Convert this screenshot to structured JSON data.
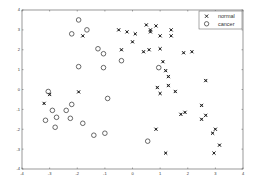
{
  "chart_data": {
    "type": "scatter",
    "title": "",
    "xlabel": "",
    "ylabel": "",
    "xlim": [
      -4,
      4
    ],
    "ylim": [
      -4,
      4
    ],
    "xticks": [
      -4,
      -3,
      -2,
      -1,
      0,
      1,
      2,
      3,
      4
    ],
    "yticks": [
      -4,
      -3,
      -2,
      -1,
      0,
      1,
      2,
      3,
      4
    ],
    "grid": false,
    "legend_position": "upper right",
    "series": [
      {
        "name": "normal",
        "marker": "x",
        "color": "#222222",
        "points": [
          [
            -3.2,
            -0.7
          ],
          [
            -3.0,
            -0.25
          ],
          [
            -1.95,
            -0.12
          ],
          [
            -1.8,
            2.7
          ],
          [
            -0.5,
            3.0
          ],
          [
            -0.2,
            2.9
          ],
          [
            0.1,
            2.8
          ],
          [
            0.0,
            2.4
          ],
          [
            -0.4,
            2.0
          ],
          [
            0.4,
            1.9
          ],
          [
            0.6,
            2.0
          ],
          [
            0.5,
            3.25
          ],
          [
            0.85,
            3.2
          ],
          [
            0.65,
            3.0
          ],
          [
            0.65,
            2.9
          ],
          [
            1.0,
            2.7
          ],
          [
            1.4,
            3.0
          ],
          [
            1.4,
            2.7
          ],
          [
            1.0,
            2.05
          ],
          [
            1.85,
            1.85
          ],
          [
            2.15,
            1.9
          ],
          [
            1.1,
            1.4
          ],
          [
            1.2,
            0.95
          ],
          [
            1.3,
            0.65
          ],
          [
            2.65,
            0.45
          ],
          [
            0.9,
            0.1
          ],
          [
            1.0,
            -0.2
          ],
          [
            1.3,
            0.2
          ],
          [
            1.55,
            -0.1
          ],
          [
            2.5,
            -0.8
          ],
          [
            1.75,
            -1.25
          ],
          [
            1.9,
            -1.15
          ],
          [
            2.65,
            -1.3
          ],
          [
            2.5,
            -1.5
          ],
          [
            0.85,
            -2.0
          ],
          [
            3.0,
            -2.0
          ],
          [
            2.9,
            -2.2
          ],
          [
            3.15,
            -2.8
          ],
          [
            1.2,
            -3.2
          ],
          [
            2.95,
            -3.2
          ]
        ]
      },
      {
        "name": "cancer",
        "marker": "o",
        "color": "#444444",
        "points": [
          [
            -1.95,
            3.5
          ],
          [
            -2.2,
            2.8
          ],
          [
            -1.65,
            3.0
          ],
          [
            -1.25,
            2.05
          ],
          [
            -1.05,
            1.8
          ],
          [
            -0.4,
            1.45
          ],
          [
            -1.95,
            1.15
          ],
          [
            -1.05,
            1.1
          ],
          [
            0.95,
            1.1
          ],
          [
            -3.05,
            -0.1
          ],
          [
            -0.9,
            -0.45
          ],
          [
            -2.9,
            -1.05
          ],
          [
            -2.2,
            -0.75
          ],
          [
            -2.4,
            -1.05
          ],
          [
            -2.75,
            -1.4
          ],
          [
            -2.25,
            -1.45
          ],
          [
            -3.15,
            -1.55
          ],
          [
            -2.8,
            -1.9
          ],
          [
            -1.8,
            -1.7
          ],
          [
            -1.4,
            -2.3
          ],
          [
            -1.0,
            -2.2
          ],
          [
            0.55,
            -2.6
          ]
        ]
      }
    ]
  },
  "legend": {
    "items": [
      {
        "label": "normal",
        "marker": "x"
      },
      {
        "label": "cancer",
        "marker": "o"
      }
    ]
  }
}
